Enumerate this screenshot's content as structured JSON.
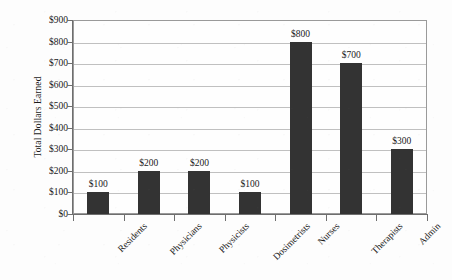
{
  "chart_data": {
    "type": "bar",
    "title": "",
    "xlabel": "",
    "ylabel": "Total Dollars Earned",
    "categories": [
      "Residents",
      "Physicians",
      "Physicists",
      "Dosimetrists",
      "Nurses",
      "Therapists",
      "Admin"
    ],
    "values": [
      100,
      200,
      200,
      100,
      800,
      700,
      300
    ],
    "value_labels": [
      "$100",
      "$200",
      "$200",
      "$100",
      "$800",
      "$700",
      "$300"
    ],
    "ylim": [
      0,
      900
    ],
    "ytick_values": [
      0,
      100,
      200,
      300,
      400,
      500,
      600,
      700,
      800,
      900
    ],
    "ytick_labels": [
      "$0",
      "$100",
      "$200",
      "$300",
      "$400",
      "$500",
      "$600",
      "$700",
      "$800",
      "$900"
    ],
    "grid": true,
    "legend": false,
    "legend_position": "none",
    "bar_color": "#333333",
    "gridline_color": "#c0c0c0",
    "axis_color": "#6e6e6e",
    "plot_background": "#fefefe",
    "page_background": "#fdfdfd"
  }
}
